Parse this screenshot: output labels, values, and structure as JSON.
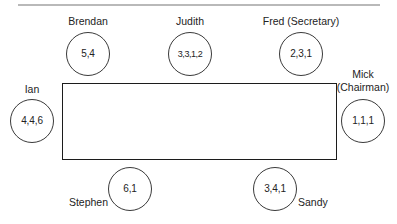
{
  "figure": {
    "top_rule": "horizontal-rule",
    "table": {
      "shape": "rectangle",
      "label": ""
    }
  },
  "seats": [
    {
      "id": "brendan",
      "name": "Brendan",
      "values": "5,4",
      "side": "top",
      "label_position": "above"
    },
    {
      "id": "judith",
      "name": "Judith",
      "values": "3,3,1,2",
      "side": "top",
      "label_position": "above"
    },
    {
      "id": "fred",
      "name": "Fred (Secretary)",
      "values": "2,3,1",
      "side": "top",
      "label_position": "above"
    },
    {
      "id": "ian",
      "name": "Ian",
      "values": "4,4,6",
      "side": "left",
      "label_position": "above"
    },
    {
      "id": "mick",
      "name_line1": "Mick",
      "name_line2": "(Chairman)",
      "values": "1,1,1",
      "side": "right",
      "label_position": "above"
    },
    {
      "id": "stephen",
      "name": "Stephen",
      "values": "6,1",
      "side": "bottom",
      "label_position": "left"
    },
    {
      "id": "sandy",
      "name": "Sandy",
      "values": "3,4,1",
      "side": "bottom",
      "label_position": "right"
    }
  ],
  "colors": {
    "stroke": "#1c1c1c",
    "circle_stroke": "#3a3a3a",
    "text": "#232323",
    "rule": "#b9b9b9",
    "background": "#ffffff"
  }
}
